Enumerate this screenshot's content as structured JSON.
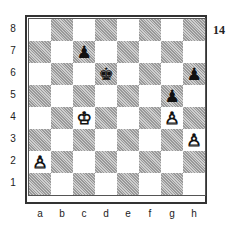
{
  "diagram": {
    "number": "14",
    "ranks": [
      "8",
      "7",
      "6",
      "5",
      "4",
      "3",
      "2",
      "1"
    ],
    "files": [
      "a",
      "b",
      "c",
      "d",
      "e",
      "f",
      "g",
      "h"
    ],
    "pieces": [
      {
        "square": "c7",
        "color": "black",
        "type": "pawn",
        "glyph": "♟"
      },
      {
        "square": "d6",
        "color": "black",
        "type": "king",
        "glyph": "♚"
      },
      {
        "square": "h6",
        "color": "black",
        "type": "pawn",
        "glyph": "♟"
      },
      {
        "square": "g5",
        "color": "black",
        "type": "pawn",
        "glyph": "♟"
      },
      {
        "square": "c4",
        "color": "white",
        "type": "king",
        "glyph": "♔"
      },
      {
        "square": "g4",
        "color": "white",
        "type": "pawn",
        "glyph": "♙"
      },
      {
        "square": "h3",
        "color": "white",
        "type": "pawn",
        "glyph": "♙"
      },
      {
        "square": "a2",
        "color": "white",
        "type": "pawn",
        "glyph": "♙"
      }
    ]
  }
}
